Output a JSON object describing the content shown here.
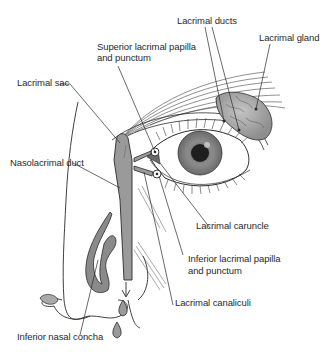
{
  "figure": {
    "colors": {
      "ink": "#2a2a2a",
      "duct_fill": "#9a9a9a",
      "gland_fill": "#a8a8a8",
      "iris": "#8a8a8a",
      "pupil": "#1e1e1e",
      "background": "#ffffff"
    }
  },
  "labels": {
    "lacrimal_ducts": "Lacrimal ducts",
    "lacrimal_gland": "Lacrimal gland",
    "superior_papilla_line1": "Superior lacrimal papilla",
    "superior_papilla_line2": "and punctum",
    "lacrimal_sac": "Lacrimal sac",
    "nasolacrimal_duct": "Nasolacrimal duct",
    "lacrimal_caruncle": "Lacrimal caruncle",
    "inferior_papilla_line1": "Inferior lacrimal papilla",
    "inferior_papilla_line2": "and punctum",
    "lacrimal_canaliculi": "Lacrimal canaliculi",
    "inferior_nasal_concha": "Inferior nasal concha"
  }
}
